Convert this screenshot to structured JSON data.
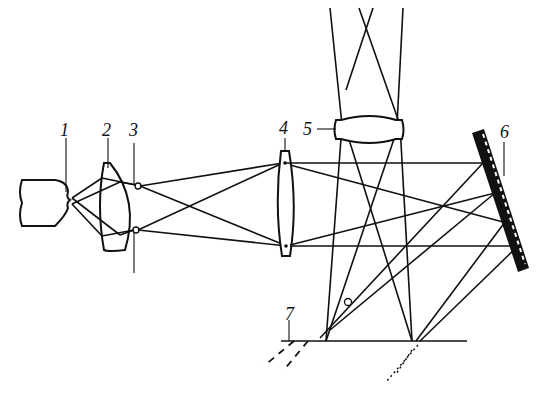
{
  "figure": {
    "type": "optical schematic",
    "labels": [
      {
        "id": "1",
        "text": "1",
        "component": "light-source"
      },
      {
        "id": "2",
        "text": "2",
        "component": "condenser-lens"
      },
      {
        "id": "3",
        "text": "3",
        "component": "slit-diaphragm"
      },
      {
        "id": "4",
        "text": "4",
        "component": "collimator-lens"
      },
      {
        "id": "5",
        "text": "5",
        "component": "objective-lens"
      },
      {
        "id": "6",
        "text": "6",
        "component": "diffraction-grating"
      },
      {
        "id": "7",
        "text": "7",
        "component": "image-plane"
      }
    ],
    "colors": {
      "ink": "#111111",
      "background": "#ffffff"
    }
  }
}
